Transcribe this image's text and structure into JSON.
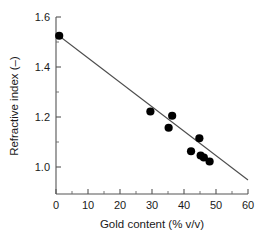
{
  "chart_data": {
    "type": "scatter",
    "title": "",
    "xlabel": "Gold content  (% v/v)",
    "ylabel": "Refractive index  (–)",
    "xlim": [
      0,
      60
    ],
    "ylim": [
      0.94,
      1.6
    ],
    "xticks": [
      0,
      10,
      20,
      30,
      40,
      50,
      60
    ],
    "xtick_labels": [
      "0",
      "10",
      "20",
      "30",
      "40",
      "50",
      "60"
    ],
    "yticks": [
      1.0,
      1.2,
      1.4,
      1.6
    ],
    "ytick_labels": [
      "1.0",
      "1.2",
      "1.4",
      "1.6"
    ],
    "x_minor_ticks": [
      5,
      15,
      25,
      35,
      45,
      55
    ],
    "y_minor_ticks": [
      1.1,
      1.3,
      1.5
    ],
    "grid": false,
    "legend": false,
    "marker": "filled-circle",
    "marker_color": "#000000",
    "points": [
      {
        "x": 1.0,
        "y": 1.525
      },
      {
        "x": 29.5,
        "y": 1.222
      },
      {
        "x": 35.2,
        "y": 1.157
      },
      {
        "x": 36.3,
        "y": 1.205
      },
      {
        "x": 42.2,
        "y": 1.063
      },
      {
        "x": 44.8,
        "y": 1.115
      },
      {
        "x": 45.2,
        "y": 1.046
      },
      {
        "x": 46.2,
        "y": 1.038
      },
      {
        "x": 48.0,
        "y": 1.022
      }
    ],
    "fit_line": {
      "name": "linear fit",
      "color": "#4d4d4d",
      "x_start": 0.6,
      "y_start": 1.528,
      "x_end": 60.0,
      "y_end": 0.948
    }
  }
}
